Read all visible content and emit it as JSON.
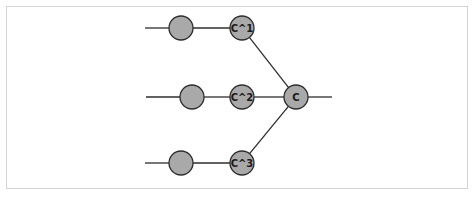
{
  "diagram": {
    "colors": {
      "node_fill": "#a9a9a9",
      "node_stroke": "#2e2e2e",
      "edge": "#2e2e2e",
      "frame_border": "#d4d4d4"
    },
    "rows": [
      {
        "input_line": {
          "x1": 145,
          "x2": 169,
          "y": 28
        },
        "unlabeled_node": {
          "cx": 181,
          "cy": 28
        },
        "labeled_node": {
          "cx": 242,
          "cy": 28,
          "label": "C^1"
        }
      },
      {
        "input_line": {
          "x1": 146,
          "x2": 180,
          "y": 97
        },
        "unlabeled_node": {
          "cx": 192,
          "cy": 97
        },
        "labeled_node": {
          "cx": 242,
          "cy": 97,
          "label": "C^2"
        }
      },
      {
        "input_line": {
          "x1": 145,
          "x2": 169,
          "y": 163
        },
        "unlabeled_node": {
          "cx": 181,
          "cy": 163
        },
        "labeled_node": {
          "cx": 242,
          "cy": 163,
          "label": "C^3"
        }
      }
    ],
    "output_node": {
      "cx": 296,
      "cy": 97,
      "label": "C"
    },
    "output_line": {
      "x1": 308,
      "x2": 332,
      "y": 97
    },
    "node_radius": 12
  }
}
